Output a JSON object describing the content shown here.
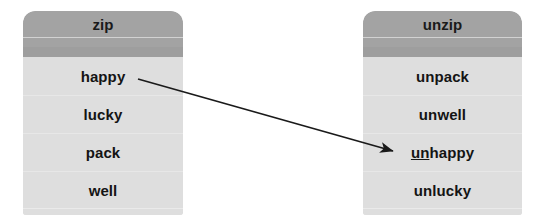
{
  "diagram": {
    "background_color": "#ffffff",
    "header_color": "#a3a3a3",
    "body_color": "#dedede",
    "text_color": "#141414",
    "arrow_color": "#1a1a1a"
  },
  "panels": [
    {
      "id": "base-words",
      "header": "zip",
      "rows": [
        {
          "text": "happy",
          "prefix": "",
          "rest": "happy"
        },
        {
          "text": "lucky",
          "prefix": "",
          "rest": "lucky"
        },
        {
          "text": "pack",
          "prefix": "",
          "rest": "pack"
        },
        {
          "text": "well",
          "prefix": "",
          "rest": "well"
        }
      ]
    },
    {
      "id": "prefixed-words",
      "header": "unzip",
      "rows": [
        {
          "text": "unpack",
          "prefix": "",
          "rest": "unpack"
        },
        {
          "text": "unwell",
          "prefix": "",
          "rest": "unwell"
        },
        {
          "text": "unhappy",
          "prefix": "un",
          "rest": "happy"
        },
        {
          "text": "unlucky",
          "prefix": "",
          "rest": "unlucky"
        }
      ]
    }
  ],
  "connector": {
    "from_label": "happy",
    "to_label": "unhappy",
    "style": "solid-arrow"
  }
}
